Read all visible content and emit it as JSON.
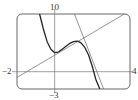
{
  "chart_data": {
    "type": "line",
    "title": "",
    "xlabel": "",
    "ylabel": "",
    "xlim": [
      -2,
      4
    ],
    "ylim": [
      -3,
      10
    ],
    "grid": false,
    "tick_labels": {
      "ymax": "10",
      "ymin": "-3",
      "xmin": "-2",
      "xmax": "4"
    },
    "series": [
      {
        "name": "curve",
        "style": "thick",
        "x": [
          -0.8,
          -0.6,
          -0.4,
          -0.2,
          0.0,
          0.2,
          0.4,
          0.6,
          0.8,
          1.0,
          1.2,
          1.4,
          1.6,
          1.8,
          2.0,
          2.2,
          2.4
        ],
        "y": [
          10.0,
          7.4,
          5.2,
          3.9,
          3.3,
          3.4,
          3.9,
          4.4,
          4.9,
          5.2,
          5.3,
          5.0,
          4.2,
          2.9,
          0.9,
          -1.5,
          -3.0
        ]
      },
      {
        "name": "line-1",
        "style": "thin",
        "x": [
          -2,
          3.7
        ],
        "y": [
          -1.0,
          10.0
        ]
      },
      {
        "name": "line-2",
        "style": "thin",
        "x": [
          1.05,
          2.6
        ],
        "y": [
          10.0,
          -3.0
        ]
      }
    ]
  },
  "colors": {
    "frame": "#555555",
    "axis": "#777777",
    "curve": "#222222",
    "line": "#666666"
  }
}
